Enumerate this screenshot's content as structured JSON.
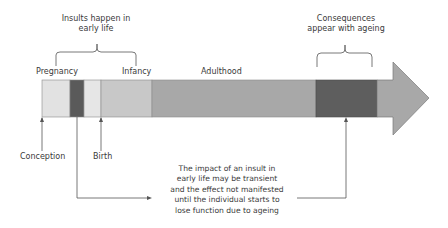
{
  "annotations": {
    "insults_title_line1": "Insults happen in",
    "insults_title_line2": "early life",
    "consequences_line1": "Consequences",
    "consequences_line2": "appear with ageing",
    "impact_note": [
      "The impact of an insult in",
      "early life may be transient",
      "and the effect not manifested",
      "until the individual starts to",
      "lose function due to ageing"
    ]
  },
  "stages": {
    "pregnancy": "Pregnancy",
    "infancy": "Infancy",
    "adulthood": "Adulthood"
  },
  "events": {
    "conception": "Conception",
    "birth": "Birth"
  },
  "timeline_segments": [
    {
      "name": "pregnancy-early",
      "color": "#e2e2e2"
    },
    {
      "name": "insult-window",
      "color": "#5a5a5a"
    },
    {
      "name": "pregnancy-late",
      "color": "#e6e6e6"
    },
    {
      "name": "infancy",
      "color": "#c8c8c8"
    },
    {
      "name": "adulthood",
      "color": "#a8a8a8"
    },
    {
      "name": "ageing-consequences",
      "color": "#5e5e5e"
    },
    {
      "name": "late-life",
      "color": "#a8a8a8"
    }
  ]
}
